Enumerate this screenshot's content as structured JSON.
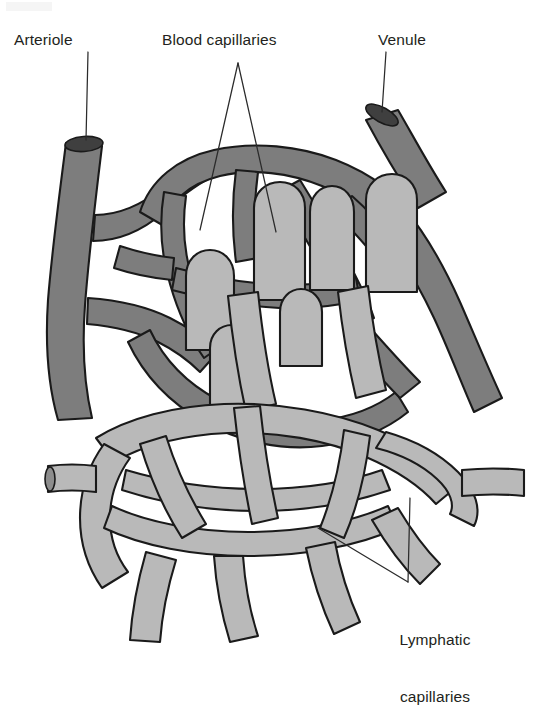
{
  "figure": {
    "background_color": "#ffffff"
  },
  "colors": {
    "blood_capillary_fill": "#7d7d7d",
    "lymphatic_capillary_fill": "#b9b9b9",
    "vessel_outline": "#1a1a1a",
    "lumen_dark": "#3a3a3a",
    "label_text": "#231f20",
    "leader_line": "#2b2b2b"
  },
  "labels": {
    "arteriole": "Arteriole",
    "blood_capillaries": "Blood capillaries",
    "venule": "Venule",
    "lymphatic_capillaries_line1": "Lymphatic",
    "lymphatic_capillaries_line2": "capillaries"
  },
  "structures": [
    {
      "id": "arteriole",
      "name": "Arteriole",
      "type": "blood-vessel",
      "shade": "dark",
      "position": "upper-left",
      "cut_end": true
    },
    {
      "id": "venule",
      "name": "Venule",
      "type": "blood-vessel",
      "shade": "dark",
      "position": "upper-right",
      "cut_end": true
    },
    {
      "id": "blood-capillaries",
      "name": "Blood capillaries",
      "type": "capillary-bed",
      "shade": "dark",
      "position": "center",
      "cut_end": false
    },
    {
      "id": "lymphatic-capillaries",
      "name": "Lymphatic capillaries",
      "type": "capillary-bed",
      "shade": "light",
      "position": "lower",
      "cut_end": true
    }
  ],
  "leader_lines": {
    "arteriole": "single vertical line from label down to arteriole cut end",
    "blood_capillaries": "two lines diverging from a single apex into the dark capillary bed",
    "venule": "single vertical line from label down to venule cut end",
    "lymphatic_capillaries": "two lines converging from the light capillary mesh to a vertex above the label"
  }
}
